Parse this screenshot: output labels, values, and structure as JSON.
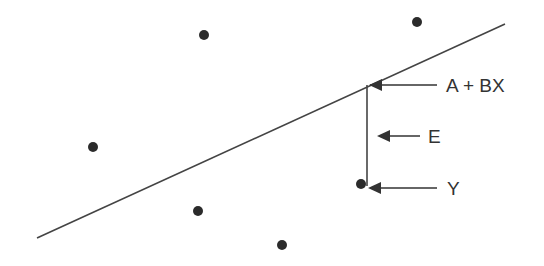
{
  "diagram": {
    "type": "regression-residual-illustration",
    "colors": {
      "line": "#444444",
      "point": "#2b2b2b",
      "text": "#333333",
      "background": "#ffffff"
    },
    "regression_line": {
      "x1": 37,
      "y1": 238,
      "x2": 505,
      "y2": 24
    },
    "points": [
      {
        "id": "p1",
        "x": 204,
        "y": 35
      },
      {
        "id": "p2",
        "x": 417,
        "y": 22
      },
      {
        "id": "p3",
        "x": 93,
        "y": 147
      },
      {
        "id": "p4",
        "x": 198,
        "y": 211
      },
      {
        "id": "p5",
        "x": 282,
        "y": 245
      },
      {
        "id": "observed",
        "x": 361,
        "y": 184
      }
    ],
    "residual": {
      "x": 367,
      "y_top": 85,
      "y_bottom": 186
    },
    "labels": {
      "fitted": "A + BX",
      "error": "E",
      "observed": "Y"
    }
  }
}
